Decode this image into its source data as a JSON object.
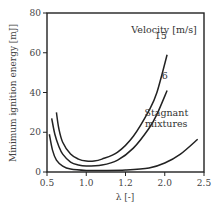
{
  "chart_data": {
    "type": "line",
    "title": "",
    "xlabel": "λ [-]",
    "ylabel": "Minimum ignition energy [mJ]",
    "xlim": [
      0.5,
      2.5
    ],
    "ylim": [
      0,
      80
    ],
    "x_ticks": [
      0.5,
      1.0,
      1.5,
      2.0,
      2.5
    ],
    "x_tick_labels": [
      "0.5",
      "1.0",
      "1.2",
      "2.0",
      "2.5"
    ],
    "y_ticks": [
      0,
      20,
      40,
      60,
      80
    ],
    "y_tick_labels": [
      "0",
      "20",
      "40",
      "60",
      "80"
    ],
    "grid": false,
    "legend": {
      "title": "Velocity [m/s]",
      "position": "inline annotations, upper right"
    },
    "series": [
      {
        "name": "15",
        "label_pos": [
          1.95,
          67
        ],
        "points": [
          [
            0.62,
            30
          ],
          [
            0.65,
            22
          ],
          [
            0.7,
            15
          ],
          [
            0.8,
            9
          ],
          [
            0.9,
            6.5
          ],
          [
            1.0,
            5.5
          ],
          [
            1.1,
            5.5
          ],
          [
            1.2,
            6.5
          ],
          [
            1.4,
            10
          ],
          [
            1.6,
            18
          ],
          [
            1.8,
            31
          ],
          [
            1.9,
            40
          ],
          [
            2.03,
            59
          ]
        ]
      },
      {
        "name": "6",
        "label_pos": [
          2.0,
          47
        ],
        "points": [
          [
            0.56,
            27
          ],
          [
            0.6,
            19
          ],
          [
            0.65,
            13
          ],
          [
            0.7,
            9
          ],
          [
            0.8,
            5
          ],
          [
            0.9,
            3.5
          ],
          [
            1.0,
            3
          ],
          [
            1.2,
            3.5
          ],
          [
            1.4,
            6
          ],
          [
            1.6,
            12
          ],
          [
            1.8,
            22
          ],
          [
            1.9,
            29
          ],
          [
            2.03,
            41
          ]
        ]
      },
      {
        "name": "Stagnant mixtures",
        "label_lines": [
          "Stagnant",
          "mixtures"
        ],
        "label_pos": [
          2.02,
          28
        ],
        "points": [
          [
            0.53,
            19
          ],
          [
            0.57,
            11
          ],
          [
            0.62,
            6
          ],
          [
            0.7,
            3
          ],
          [
            0.8,
            1.5
          ],
          [
            1.0,
            0.8
          ],
          [
            1.2,
            0.8
          ],
          [
            1.5,
            1
          ],
          [
            1.8,
            2
          ],
          [
            2.0,
            4.5
          ],
          [
            2.2,
            9
          ],
          [
            2.42,
            16.5
          ]
        ]
      }
    ]
  }
}
